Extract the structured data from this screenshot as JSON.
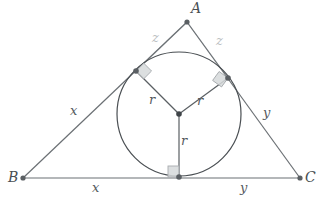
{
  "figure": {
    "background_color": "#ffffff",
    "colors": {
      "triangle_stroke": "#6b7074",
      "circle_stroke": "#4a4f53",
      "radius_stroke": "#5a5f63",
      "light_stroke": "#c6cacd",
      "label": "#555a5e",
      "label_light": "#b9bdc0",
      "vertex_dot": "#5a5f63",
      "right_angle_fill": "#d6d9db",
      "right_angle_stroke": "#a8acaf"
    }
  },
  "vertices": {
    "a": {
      "label": "A",
      "x": 187,
      "y": 22,
      "label_x": 191,
      "label_y": 13
    },
    "b": {
      "label": "B",
      "x": 23,
      "y": 178,
      "label_x": 8,
      "label_y": 182
    },
    "c": {
      "label": "C",
      "x": 300,
      "y": 178,
      "label_x": 305,
      "label_y": 182
    }
  },
  "incircle": {
    "center_x": 179,
    "center_y": 114,
    "radius": 62,
    "center_label": "incenter"
  },
  "tangent_points": {
    "left": {
      "x": 136,
      "y": 71,
      "name": "tangent-point-ab"
    },
    "right": {
      "x": 228,
      "y": 78,
      "name": "tangent-point-ac"
    },
    "bottom": {
      "x": 179,
      "y": 177,
      "name": "tangent-point-bc"
    }
  },
  "labels": {
    "z_left": {
      "text": "z",
      "x": 152,
      "y": 42
    },
    "z_right": {
      "text": "z",
      "x": 216,
      "y": 45
    },
    "x_side": {
      "text": "x",
      "x": 70,
      "y": 115
    },
    "y_side": {
      "text": "y",
      "x": 263,
      "y": 117
    },
    "x_base": {
      "text": "x",
      "x": 92,
      "y": 192
    },
    "y_base": {
      "text": "y",
      "x": 240,
      "y": 192
    },
    "r_left": {
      "text": "r",
      "x": 149,
      "y": 104
    },
    "r_right": {
      "text": "r",
      "x": 197,
      "y": 105
    },
    "r_bottom": {
      "text": "r",
      "x": 181,
      "y": 145
    }
  }
}
